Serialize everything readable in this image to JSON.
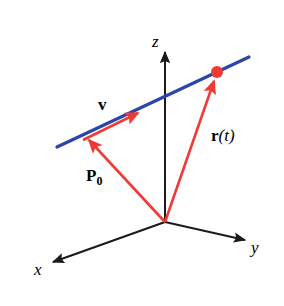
{
  "figure": {
    "background_color": "#ffffff",
    "width": 284,
    "height": 306
  },
  "colors": {
    "axis": "#1a1a1a",
    "line": "#2b46a8",
    "vector": "#ef3b33",
    "point": "#ef3b33",
    "label": "#000000"
  },
  "axes": {
    "origin": {
      "x": 165,
      "y": 222
    },
    "z": {
      "label": "z",
      "tip": {
        "x": 165,
        "y": 51
      },
      "label_pos": {
        "x": 152,
        "y": 33
      }
    },
    "y": {
      "label": "y",
      "tip": {
        "x": 247,
        "y": 240
      },
      "label_pos": {
        "x": 251,
        "y": 239
      }
    },
    "x": {
      "label": "x",
      "tip": {
        "x": 50,
        "y": 262
      },
      "label_pos": {
        "x": 34,
        "y": 261
      }
    }
  },
  "line": {
    "name": "blue-line",
    "start": {
      "x": 57,
      "y": 147
    },
    "end": {
      "x": 249,
      "y": 57
    },
    "color": "#2b46a8",
    "width": 3
  },
  "point": {
    "name": "point-on-line",
    "center": {
      "x": 217,
      "y": 72
    },
    "radius": 6,
    "color": "#ef3b33"
  },
  "vectors": [
    {
      "id": "p0",
      "label": "P",
      "subscript": "0",
      "from": {
        "x": 165,
        "y": 222
      },
      "to": {
        "x": 86,
        "y": 137
      },
      "label_pos": {
        "x": 86,
        "y": 167
      },
      "color": "#ef3b33"
    },
    {
      "id": "v",
      "label": "v",
      "subscript": "",
      "from": {
        "x": 84,
        "y": 139
      },
      "to": {
        "x": 142,
        "y": 111
      },
      "label_pos": {
        "x": 98,
        "y": 96
      },
      "color": "#ef3b33"
    },
    {
      "id": "rt",
      "label": "r",
      "argument": "(t)",
      "from": {
        "x": 165,
        "y": 222
      },
      "to": {
        "x": 215,
        "y": 76
      },
      "label_pos": {
        "x": 211,
        "y": 127
      },
      "color": "#ef3b33"
    }
  ],
  "labels": {
    "z": "z",
    "y": "y",
    "x": "x",
    "v": "v",
    "p": "P",
    "p_sub": "0",
    "r": "r",
    "r_arg": "(t)"
  }
}
